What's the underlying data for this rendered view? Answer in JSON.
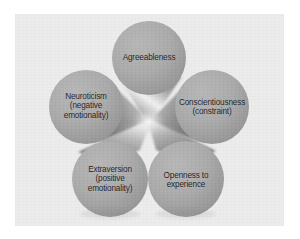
{
  "figure": {
    "kind": "five-lobe-cone-diagram",
    "background_color": "#ffffff",
    "panel_color": "#ececec",
    "lobe_fill_color": "#a9a9a9",
    "lobe_shade_color": "#8d8d8d",
    "cone_highlight_color": "#ffffff",
    "cone_shadow_color": "#6f6f6f",
    "label_color": "#17171a"
  },
  "lobes": [
    {
      "id": "agreeableness",
      "position": "top",
      "lines": [
        "Agreeableness"
      ],
      "cx": 149,
      "cy": 58,
      "r": 37
    },
    {
      "id": "conscientiousness",
      "position": "right",
      "lines": [
        "Conscientiousness",
        "(constraint)"
      ],
      "cx": 212,
      "cy": 107,
      "r": 37
    },
    {
      "id": "neuroticism",
      "position": "left",
      "lines": [
        "Neuroticism",
        "(negative",
        "emotionality)"
      ],
      "cx": 86,
      "cy": 107,
      "r": 37
    },
    {
      "id": "extraversion",
      "position": "bottom-left",
      "lines": [
        "Extraversion",
        "(positive",
        "emotionality)"
      ],
      "cx": 110,
      "cy": 179,
      "r": 38
    },
    {
      "id": "openness",
      "position": "bottom-right",
      "lines": [
        "Openness to",
        "experience"
      ],
      "cx": 186,
      "cy": 179,
      "r": 38
    }
  ]
}
